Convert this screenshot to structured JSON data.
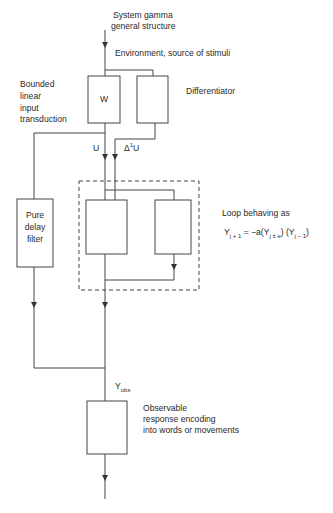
{
  "title": {
    "line1": "System gamma",
    "line2": "general structure"
  },
  "environment_label": "Environment, source of stimuli",
  "input_transduction_label": {
    "line1": "Bounded",
    "line2": "linear",
    "line3": "input",
    "line4": "transduction"
  },
  "blocks": {
    "w_block": "W",
    "differentiator_label": "Differentiator",
    "pure_delay": {
      "line1": "Pure",
      "line2": "delay",
      "line3": "filter"
    },
    "observable_response": {
      "line1": "Observable",
      "line2": "response encoding",
      "line3": "into words or movements"
    }
  },
  "signals": {
    "u": "U",
    "delta_u_main": "Δ",
    "delta_u_sup": "1",
    "delta_u_tail": "U",
    "y_obs_main": "Y",
    "y_obs_sub": "obs"
  },
  "loop": {
    "label": "Loop behaving as",
    "eq_y": "Y",
    "eq_sub1": "j + 1",
    "eq_mid": " = −a(Y",
    "eq_sub2": "j ± e",
    "eq_mid2": ") (Y",
    "eq_sub3": "j − 1",
    "eq_end": ")"
  }
}
